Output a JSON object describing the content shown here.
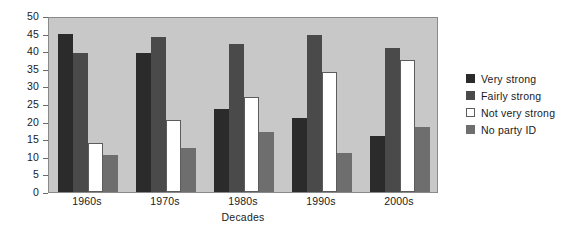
{
  "chart_data": {
    "type": "bar",
    "title": "",
    "xlabel": "Decades",
    "ylabel": "",
    "categories": [
      "1960s",
      "1970s",
      "1980s",
      "1990s",
      "2000s"
    ],
    "series": [
      {
        "name": "Very strong",
        "color": "#2b2b2b",
        "values": [
          45,
          39.5,
          23.5,
          21,
          16
        ]
      },
      {
        "name": "Fairly strong",
        "color": "#4a4a4a",
        "values": [
          39.5,
          44,
          42,
          44.5,
          41
        ]
      },
      {
        "name": "Not very strong",
        "color": "#ffffff",
        "values": [
          14,
          20.5,
          27,
          34,
          37.5
        ]
      },
      {
        "name": "No party ID",
        "color": "#6e6e6e",
        "values": [
          10.5,
          12.5,
          17,
          11,
          18.5
        ]
      }
    ],
    "ylim": [
      0,
      50
    ],
    "yticks": [
      "0",
      "5",
      "10",
      "15",
      "20",
      "25",
      "30",
      "35",
      "40",
      "45",
      "50"
    ],
    "grid": false,
    "legend_position": "right",
    "plot_background": "#c8c8c8"
  },
  "legend": {
    "items": [
      {
        "label": "Very strong"
      },
      {
        "label": "Fairly strong"
      },
      {
        "label": "Not very strong"
      },
      {
        "label": "No party ID"
      }
    ]
  }
}
